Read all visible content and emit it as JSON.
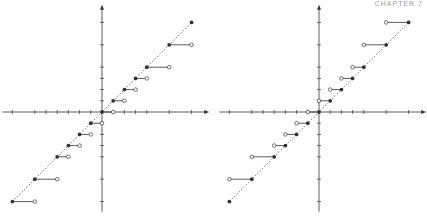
{
  "header": {
    "chapter_label": "CHAPTER 7"
  },
  "chart_data": [
    {
      "type": "scatter",
      "title": "",
      "xlabel": "",
      "ylabel": "",
      "grid": false,
      "description": "Step function: filled points on dashed diagonal y=x, horizontal segments to open points on the right",
      "origin_px": [
        102,
        112
      ],
      "unit_px": 11.2,
      "xlim": [
        -8,
        8
      ],
      "ylim": [
        -8,
        8
      ],
      "x_ticks": [
        -8,
        -6,
        -5,
        -4,
        -3,
        -2,
        -1,
        0,
        1,
        2,
        3,
        4,
        6,
        8
      ],
      "y_ticks": [
        -8,
        -6,
        -4,
        -3,
        -2,
        -1,
        0,
        1,
        2,
        3,
        4,
        6,
        8
      ],
      "filled_points": [
        [
          -8,
          -8
        ],
        [
          -6,
          -6
        ],
        [
          -4,
          -4
        ],
        [
          -3,
          -3
        ],
        [
          -2,
          -2
        ],
        [
          -1,
          -1
        ],
        [
          0,
          0
        ],
        [
          1,
          1
        ],
        [
          2,
          2
        ],
        [
          3,
          3
        ],
        [
          4,
          4
        ],
        [
          6,
          6
        ],
        [
          8,
          8
        ]
      ],
      "segments": [
        {
          "from": [
            -8,
            -8
          ],
          "to": [
            -6,
            -8
          ]
        },
        {
          "from": [
            -6,
            -6
          ],
          "to": [
            -4,
            -6
          ]
        },
        {
          "from": [
            -4,
            -4
          ],
          "to": [
            -3,
            -4
          ]
        },
        {
          "from": [
            -3,
            -3
          ],
          "to": [
            -2,
            -3
          ]
        },
        {
          "from": [
            -2,
            -2
          ],
          "to": [
            -1,
            -2
          ]
        },
        {
          "from": [
            -1,
            -1
          ],
          "to": [
            0,
            -1
          ]
        },
        {
          "from": [
            0,
            0
          ],
          "to": [
            1,
            0
          ]
        },
        {
          "from": [
            1,
            1
          ],
          "to": [
            2,
            1
          ]
        },
        {
          "from": [
            2,
            2
          ],
          "to": [
            3,
            2
          ]
        },
        {
          "from": [
            3,
            3
          ],
          "to": [
            4,
            3
          ]
        },
        {
          "from": [
            4,
            4
          ],
          "to": [
            6,
            4
          ]
        },
        {
          "from": [
            6,
            6
          ],
          "to": [
            8,
            6
          ]
        }
      ]
    },
    {
      "type": "scatter",
      "title": "",
      "xlabel": "",
      "ylabel": "",
      "grid": false,
      "description": "Step function: filled points on dashed diagonal y=x, horizontal segments to open points on the left",
      "origin_px": [
        319,
        112
      ],
      "unit_px": 11.2,
      "xlim": [
        -8,
        8
      ],
      "ylim": [
        -8,
        8
      ],
      "x_ticks": [
        -8,
        -6,
        -5,
        -4,
        -3,
        -2,
        -1,
        0,
        1,
        2,
        3,
        4,
        6,
        8
      ],
      "y_ticks": [
        -8,
        -6,
        -4,
        -3,
        -2,
        -1,
        0,
        1,
        2,
        3,
        4,
        6,
        8
      ],
      "filled_points": [
        [
          -8,
          -8
        ],
        [
          -6,
          -6
        ],
        [
          -4,
          -4
        ],
        [
          -3,
          -3
        ],
        [
          -2,
          -2
        ],
        [
          -1,
          -1
        ],
        [
          0,
          0
        ],
        [
          1,
          1
        ],
        [
          2,
          2
        ],
        [
          3,
          3
        ],
        [
          4,
          4
        ],
        [
          6,
          6
        ],
        [
          8,
          8
        ]
      ],
      "segments": [
        {
          "from": [
            -6,
            -6
          ],
          "to": [
            -8,
            -6
          ]
        },
        {
          "from": [
            -4,
            -4
          ],
          "to": [
            -6,
            -4
          ]
        },
        {
          "from": [
            -3,
            -3
          ],
          "to": [
            -4,
            -3
          ]
        },
        {
          "from": [
            -2,
            -2
          ],
          "to": [
            -3,
            -2
          ]
        },
        {
          "from": [
            -1,
            -1
          ],
          "to": [
            -2,
            -1
          ]
        },
        {
          "from": [
            0,
            0
          ],
          "to": [
            -1,
            0
          ]
        },
        {
          "from": [
            1,
            1
          ],
          "to": [
            0,
            1
          ]
        },
        {
          "from": [
            2,
            2
          ],
          "to": [
            1,
            2
          ]
        },
        {
          "from": [
            3,
            3
          ],
          "to": [
            2,
            3
          ]
        },
        {
          "from": [
            4,
            4
          ],
          "to": [
            3,
            4
          ]
        },
        {
          "from": [
            6,
            6
          ],
          "to": [
            4,
            6
          ]
        },
        {
          "from": [
            8,
            8
          ],
          "to": [
            6,
            8
          ]
        }
      ]
    }
  ],
  "style": {
    "axis_color": "#333333",
    "point_color": "#333333",
    "diag_color": "#555555"
  }
}
